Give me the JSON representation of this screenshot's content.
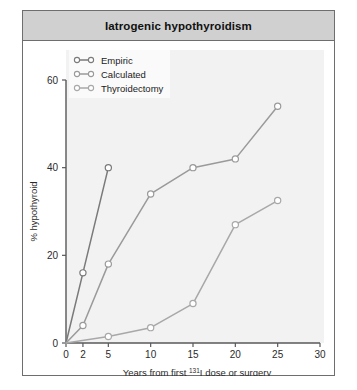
{
  "figure": {
    "title": "Iatrogenic hypothyroidism",
    "border_color": "#6e6e6e",
    "title_bar_color": "#d0d0d0",
    "plot_background": "#f2f2f2"
  },
  "chart_data": {
    "type": "line",
    "title": "Iatrogenic hypothyroidism",
    "xlabel": "Years from first 131I dose or surgery",
    "xlabel_prefix": "Years from first ",
    "xlabel_superscript": "131",
    "xlabel_suffix": "I dose or surgery",
    "ylabel": "% hypothyroid",
    "xlim": [
      0,
      30
    ],
    "ylim": [
      0,
      60
    ],
    "xticks": [
      0,
      2,
      5,
      10,
      15,
      20,
      25,
      30
    ],
    "yticks": [
      0,
      20,
      40,
      60
    ],
    "grid": false,
    "legend_position": "top-left",
    "series": [
      {
        "name": "Empiric",
        "color": "#7a7a7a",
        "marker": "open-circle",
        "x": [
          0,
          2,
          5
        ],
        "y": [
          0,
          16,
          40
        ]
      },
      {
        "name": "Calculated",
        "color": "#9a9a9a",
        "marker": "open-circle",
        "x": [
          0,
          2,
          5,
          10,
          15,
          20,
          25
        ],
        "y": [
          0,
          4,
          18,
          34,
          40,
          42,
          54
        ]
      },
      {
        "name": "Thyroidectomy",
        "color": "#a8a8a8",
        "marker": "open-circle",
        "x": [
          0,
          5,
          10,
          15,
          20,
          25
        ],
        "y": [
          0,
          1.5,
          3.5,
          9,
          27,
          32.5
        ]
      }
    ]
  }
}
